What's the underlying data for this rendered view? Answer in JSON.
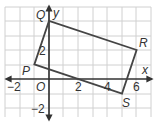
{
  "diagram": {
    "type": "coordinate-plane",
    "axes": {
      "x_label": "x",
      "y_label": "y",
      "origin_label": "O"
    },
    "tick_labels": {
      "x": [
        {
          "value": -2,
          "text": "−2"
        },
        {
          "value": 2,
          "text": "2"
        },
        {
          "value": 4,
          "text": "4"
        },
        {
          "value": 6,
          "text": "6"
        }
      ],
      "y": [
        {
          "value": 2,
          "text": "2"
        },
        {
          "value": -2,
          "text": "−2"
        }
      ]
    },
    "grid": {
      "x_range": [
        -3,
        7
      ],
      "y_range": [
        -3,
        5
      ],
      "step": 1
    },
    "polygon": {
      "name": "PQRS",
      "vertices": [
        {
          "label": "P",
          "x": -1,
          "y": 1
        },
        {
          "label": "Q",
          "x": 0,
          "y": 4
        },
        {
          "label": "R",
          "x": 6,
          "y": 2
        },
        {
          "label": "S",
          "x": 5,
          "y": -1
        }
      ],
      "stroke": "#444444"
    },
    "colors": {
      "grid": "#d0d0d0",
      "axis": "#333333",
      "shape": "#444444"
    }
  }
}
